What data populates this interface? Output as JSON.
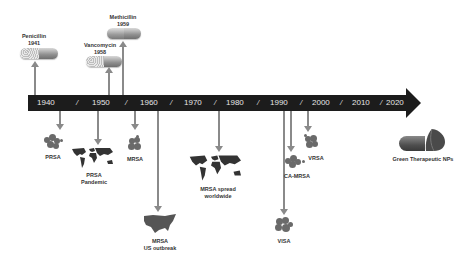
{
  "timeline": {
    "ticks": [
      "1940",
      "1950",
      "1960",
      "1970",
      "1980",
      "1990",
      "2000",
      "2010",
      "2020"
    ],
    "separator": "/",
    "bar_color": "#1c1c1c",
    "arrow_color": "#8a8a8a"
  },
  "above_events": [
    {
      "name": "Penicillin",
      "year": "1941",
      "icon": "capsule-icon"
    },
    {
      "name": "Vancomycin",
      "year": "1958",
      "icon": "capsule-icon"
    },
    {
      "name": "Methicillin",
      "year": "1959",
      "icon": "capsule-icon"
    }
  ],
  "below_events": [
    {
      "line1": "PRSA",
      "line2": "",
      "icon": "bacteria-cluster-icon"
    },
    {
      "line1": "PRSA",
      "line2": "Pandemic",
      "icon": "world-map-icon"
    },
    {
      "line1": "MRSA",
      "line2": "",
      "icon": "bacteria-cluster-icon"
    },
    {
      "line1": "MRSA",
      "line2": "US outbreak",
      "icon": "us-map-icon"
    },
    {
      "line1": "MRSA spread",
      "line2": "worldwide",
      "icon": "world-map-icon"
    },
    {
      "line1": "VISA",
      "line2": "",
      "icon": "bacteria-cluster-icon"
    },
    {
      "line1": "CA-MRSA",
      "line2": "",
      "icon": "bacteria-cluster-icon"
    },
    {
      "line1": "VRSA",
      "line2": "",
      "icon": "bacteria-cluster-icon"
    }
  ],
  "future": {
    "label": "Green Therapeutic NPs",
    "icon": "nanoparticle-capsule-icon"
  }
}
